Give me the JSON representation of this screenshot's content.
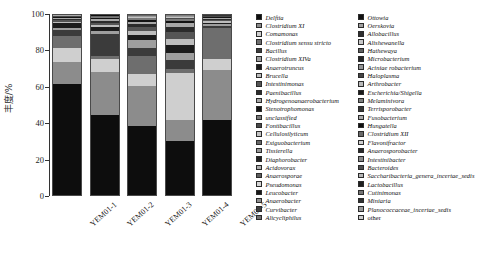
{
  "chart_data": {
    "type": "bar",
    "subtype": "stacked-bar-100",
    "title": "",
    "xlabel": "",
    "ylabel": "丰度/%",
    "ylim": [
      0,
      100
    ],
    "yticks": [
      0,
      20,
      40,
      60,
      80,
      100
    ],
    "ytick_labels": [
      "0",
      "20",
      "40",
      "60",
      "80",
      "100"
    ],
    "grid": false,
    "legend_position": "right",
    "categories": [
      "YEM01-1",
      "YEM01-2",
      "YEM01-3",
      "YEM01-4",
      "YEM01-5"
    ],
    "series": [
      {
        "name": "Delftia",
        "color": "#0d0d0d",
        "values": [
          62.0,
          44.0,
          38.0,
          30.0,
          42.0
        ]
      },
      {
        "name": "Clostridium XI",
        "color": "#8c8c8c",
        "values": [
          12.5,
          24.0,
          22.0,
          12.0,
          28.0
        ]
      },
      {
        "name": "Comamonas",
        "color": "#cfcfcf",
        "values": [
          7.5,
          7.0,
          7.0,
          26.0,
          6.0
        ]
      },
      {
        "name": "Clostridium sensu stricto",
        "color": "#6e6e6e",
        "values": [
          7.0,
          2.0,
          10.0,
          2.5,
          17.0
        ]
      },
      {
        "name": "Bacillus",
        "color": "#3b3b3b",
        "values": [
          3.0,
          12.0,
          4.0,
          5.0,
          1.5
        ]
      },
      {
        "name": "Clostridium XIVa",
        "color": "#9e9e9e",
        "values": [
          1.5,
          1.5,
          4.5,
          4.0,
          0.8
        ]
      },
      {
        "name": "Anaerotruncus",
        "color": "#1c1c1c",
        "values": [
          2.5,
          2.0,
          3.0,
          4.5,
          1.0
        ]
      },
      {
        "name": "Brucella",
        "color": "#bdbdbd",
        "values": [
          0.8,
          1.2,
          2.0,
          3.0,
          0.7
        ]
      },
      {
        "name": "Intestinimonas",
        "color": "#555555",
        "values": [
          1.0,
          1.5,
          2.5,
          4.0,
          0.8
        ]
      },
      {
        "name": "Paenibacillus",
        "color": "#2b2b2b",
        "values": [
          0.7,
          1.0,
          1.5,
          3.0,
          0.6
        ]
      },
      {
        "name": "Hydrogenoanaerobacterium",
        "color": "#a8a8a8",
        "values": [
          0.5,
          0.8,
          1.2,
          2.0,
          0.5
        ]
      },
      {
        "name": "Stenotrophomonas",
        "color": "#141414",
        "values": [
          0.4,
          0.6,
          1.0,
          1.5,
          0.4
        ]
      },
      {
        "name": "unclassified",
        "color": "#7a7a7a",
        "values": [
          0.3,
          0.5,
          0.8,
          1.2,
          0.3
        ]
      },
      {
        "name": "Fontibacillus",
        "color": "#4a4a4a",
        "values": [
          0.1,
          0.3,
          0.5,
          0.6,
          0.2
        ]
      },
      {
        "name": "Cellulosilyticum",
        "color": "#c4c4c4",
        "values": [
          0.05,
          0.2,
          0.3,
          0.3,
          0.1
        ]
      },
      {
        "name": "Exiguobacterium",
        "color": "#666666",
        "values": [
          0.05,
          0.1,
          0.2,
          0.2,
          0.05
        ]
      },
      {
        "name": "Tissierella",
        "color": "#999999",
        "values": [
          0.05,
          0.1,
          0.15,
          0.15,
          0.05
        ]
      },
      {
        "name": "Diaphorobacter",
        "color": "#232323",
        "values": [
          0.05,
          0.05,
          0.1,
          0.1,
          0.05
        ]
      },
      {
        "name": "Acidovorax",
        "color": "#b0b0b0",
        "values": [
          0.05,
          0.05,
          0.08,
          0.08,
          0.04
        ]
      },
      {
        "name": "Anaerosporae",
        "color": "#5e5e5e",
        "values": [
          0.04,
          0.04,
          0.06,
          0.06,
          0.03
        ]
      },
      {
        "name": "Pseudomonas",
        "color": "#d6d6d6",
        "values": [
          0.03,
          0.03,
          0.05,
          0.05,
          0.03
        ]
      },
      {
        "name": "Leucobacter",
        "color": "#181818",
        "values": [
          0.03,
          0.03,
          0.04,
          0.04,
          0.02
        ]
      },
      {
        "name": "Anaerobacter",
        "color": "#8f8f8f",
        "values": [
          0.02,
          0.02,
          0.03,
          0.03,
          0.02
        ]
      },
      {
        "name": "Curvibacter",
        "color": "#3f3f3f",
        "values": [
          0.02,
          0.02,
          0.02,
          0.02,
          0.02
        ]
      },
      {
        "name": "Alicycliphilus",
        "color": "#707070",
        "values": [
          0.02,
          0.02,
          0.02,
          0.02,
          0.02
        ]
      },
      {
        "name": "Ottowia",
        "color": "#111111",
        "values": [
          0.02,
          0.02,
          0.02,
          0.02,
          0.02
        ]
      },
      {
        "name": "Oerskovia",
        "color": "#a0a0a0",
        "values": [
          0.02,
          0.02,
          0.02,
          0.02,
          0.02
        ]
      },
      {
        "name": "Allobacillus",
        "color": "#2f2f2f",
        "values": [
          0.02,
          0.02,
          0.02,
          0.02,
          0.02
        ]
      },
      {
        "name": "Alishewanella",
        "color": "#c9c9c9",
        "values": [
          0.01,
          0.01,
          0.01,
          0.01,
          0.01
        ]
      },
      {
        "name": "Hathewaya",
        "color": "#606060",
        "values": [
          0.01,
          0.01,
          0.01,
          0.01,
          0.01
        ]
      },
      {
        "name": "Microbacterium",
        "color": "#252525",
        "values": [
          0.01,
          0.01,
          0.01,
          0.01,
          0.01
        ]
      },
      {
        "name": "Aciniae robacterium",
        "color": "#949494",
        "values": [
          0.01,
          0.01,
          0.01,
          0.01,
          0.01
        ]
      },
      {
        "name": "Haloplasma",
        "color": "#444444",
        "values": [
          0.01,
          0.01,
          0.01,
          0.01,
          0.01
        ]
      },
      {
        "name": "Arthrobacter",
        "color": "#bababa",
        "values": [
          0.01,
          0.01,
          0.01,
          0.01,
          0.01
        ]
      },
      {
        "name": "Escherichia/Shigella",
        "color": "#1a1a1a",
        "values": [
          0.01,
          0.01,
          0.01,
          0.01,
          0.01
        ]
      },
      {
        "name": "Melaminivora",
        "color": "#808080",
        "values": [
          0.01,
          0.01,
          0.01,
          0.01,
          0.01
        ]
      },
      {
        "name": "Terrisporobacter",
        "color": "#353535",
        "values": [
          0.01,
          0.01,
          0.01,
          0.01,
          0.01
        ]
      },
      {
        "name": "Fusobacterium",
        "color": "#aaaaaa",
        "values": [
          0.01,
          0.01,
          0.01,
          0.01,
          0.01
        ]
      },
      {
        "name": "Hungatella",
        "color": "#0f0f0f",
        "values": [
          0.01,
          0.01,
          0.01,
          0.01,
          0.01
        ]
      },
      {
        "name": "Clostridium XII",
        "color": "#6a6a6a",
        "values": [
          0.01,
          0.01,
          0.01,
          0.01,
          0.01
        ]
      },
      {
        "name": "Flavonifractor",
        "color": "#d0d0d0",
        "values": [
          0.01,
          0.01,
          0.01,
          0.01,
          0.01
        ]
      },
      {
        "name": "Anaerosporobacter",
        "color": "#282828",
        "values": [
          0.01,
          0.01,
          0.01,
          0.01,
          0.01
        ]
      },
      {
        "name": "Intestinibacter",
        "color": "#8a8a8a",
        "values": [
          0.01,
          0.01,
          0.01,
          0.01,
          0.01
        ]
      },
      {
        "name": "Bacteroides",
        "color": "#4e4e4e",
        "values": [
          0.01,
          0.01,
          0.01,
          0.01,
          0.01
        ]
      },
      {
        "name": "Saccharibacteria genera incertae sedis",
        "color": "#b6b6b6",
        "values": [
          0.01,
          0.01,
          0.01,
          0.01,
          0.01
        ]
      },
      {
        "name": "Lactobacillus",
        "color": "#1f1f1f",
        "values": [
          0.01,
          0.01,
          0.01,
          0.01,
          0.01
        ]
      },
      {
        "name": "Cutinimonas",
        "color": "#757575",
        "values": [
          0.01,
          0.01,
          0.01,
          0.01,
          0.01
        ]
      },
      {
        "name": "Miniaria",
        "color": "#303030",
        "values": [
          0.01,
          0.01,
          0.01,
          0.01,
          0.01
        ]
      },
      {
        "name": "Planococcaceae_incertae_sedis",
        "color": "#9a9a9a",
        "values": [
          0.01,
          0.01,
          0.01,
          0.01,
          0.01
        ]
      },
      {
        "name": "other",
        "color": "#cdcdcd",
        "values": [
          0.01,
          0.01,
          0.01,
          0.01,
          0.01
        ]
      }
    ]
  },
  "axis": {
    "y_label": "丰度/%",
    "y_ticks": [
      "100",
      "80",
      "60",
      "40",
      "20",
      "0"
    ],
    "x_ticks": [
      "YEM01-1",
      "YEM01-2",
      "YEM01-3",
      "YEM01-4",
      "YEM01-5"
    ]
  },
  "legend": {
    "columns": [
      [
        {
          "label": "Delftia",
          "color": "#0d0d0d",
          "italic": true
        },
        {
          "label": "Clostridium XI",
          "color": "#8c8c8c",
          "italic": true
        },
        {
          "label": "Comamonas",
          "color": "#cfcfcf",
          "italic": true
        },
        {
          "label": "Clostridium sensu stricto",
          "color": "#6e6e6e",
          "italic": true
        },
        {
          "label": "Bacillus",
          "color": "#3b3b3b",
          "italic": true
        },
        {
          "label": "Clostridium XIVa",
          "color": "#9e9e9e",
          "italic": true
        },
        {
          "label": "Anaerotruncus",
          "color": "#1c1c1c",
          "italic": true
        },
        {
          "label": "Brucella",
          "color": "#bdbdbd",
          "italic": true
        },
        {
          "label": "Intestinimonas",
          "color": "#555555",
          "italic": true
        },
        {
          "label": "Paenibacillus",
          "color": "#2b2b2b",
          "italic": true
        },
        {
          "label": "Hydrogenoanaerobacterium",
          "color": "#a8a8a8",
          "italic": true
        },
        {
          "label": "Stenotrophomonas",
          "color": "#141414",
          "italic": true
        },
        {
          "label": "unclassified",
          "color": "#7a7a7a",
          "italic": true
        },
        {
          "label": "Fontibacillus",
          "color": "#4a4a4a",
          "italic": true
        },
        {
          "label": "Cellulosilyticum",
          "color": "#c4c4c4",
          "italic": true
        },
        {
          "label": "Exiguobacterium",
          "color": "#666666",
          "italic": true
        },
        {
          "label": "Tissierella",
          "color": "#999999",
          "italic": true
        },
        {
          "label": "Diaphorobacter",
          "color": "#232323",
          "italic": true
        },
        {
          "label": "Acidovorax",
          "color": "#b0b0b0",
          "italic": true
        },
        {
          "label": "Anaerosporae",
          "color": "#5e5e5e",
          "italic": true
        },
        {
          "label": "Pseudomonas",
          "color": "#d6d6d6",
          "italic": true
        },
        {
          "label": "Leucobacter",
          "color": "#181818",
          "italic": true
        },
        {
          "label": "Anaerobacter",
          "color": "#8f8f8f",
          "italic": true
        },
        {
          "label": "Curvibacter",
          "color": "#3f3f3f",
          "italic": true
        },
        {
          "label": "Alicycliphilus",
          "color": "#707070",
          "italic": true
        }
      ],
      [
        {
          "label": "Ottowia",
          "color": "#111111",
          "italic": true
        },
        {
          "label": "Oerskovia",
          "color": "#a0a0a0",
          "italic": true
        },
        {
          "label": "Allobacillus",
          "color": "#2f2f2f",
          "italic": true
        },
        {
          "label": "Alishewanella",
          "color": "#c9c9c9",
          "italic": true
        },
        {
          "label": "Hathewaya",
          "color": "#606060",
          "italic": true
        },
        {
          "label": "Microbacterium",
          "color": "#252525",
          "italic": true
        },
        {
          "label": "Aciniae robacterium",
          "color": "#949494",
          "italic": true
        },
        {
          "label": "Haloplasma",
          "color": "#444444",
          "italic": true
        },
        {
          "label": "Arthrobacter",
          "color": "#bababa",
          "italic": true
        },
        {
          "label": "Escherichia/Shigella",
          "color": "#1a1a1a",
          "italic": true
        },
        {
          "label": "Melaminivora",
          "color": "#808080",
          "italic": true
        },
        {
          "label": "Terrisporobacter",
          "color": "#353535",
          "italic": true
        },
        {
          "label": "Fusobacterium",
          "color": "#aaaaaa",
          "italic": true
        },
        {
          "label": "Hungatella",
          "color": "#0f0f0f",
          "italic": true
        },
        {
          "label": "Clostridium XII",
          "color": "#6a6a6a",
          "italic": true
        },
        {
          "label": "Flavonifractor",
          "color": "#d0d0d0",
          "italic": true
        },
        {
          "label": "Anaerosporobacter",
          "color": "#282828",
          "italic": true
        },
        {
          "label": "Intestinibacter",
          "color": "#8a8a8a",
          "italic": true
        },
        {
          "label": "Bacteroides",
          "color": "#4e4e4e",
          "italic": true
        },
        {
          "label": "Saccharibacteria_genera_incertae_sedis",
          "color": "#b6b6b6",
          "italic": true
        },
        {
          "label": "Lactobacillus",
          "color": "#1f1f1f",
          "italic": true
        },
        {
          "label": "Cutinimonas",
          "color": "#757575",
          "italic": true
        },
        {
          "label": "Miniaria",
          "color": "#303030",
          "italic": true
        },
        {
          "label": "Planococcaceae_incertae_sedis",
          "color": "#9a9a9a",
          "italic": true
        },
        {
          "label": "other",
          "color": "#cdcdcd",
          "italic": false
        }
      ]
    ]
  }
}
